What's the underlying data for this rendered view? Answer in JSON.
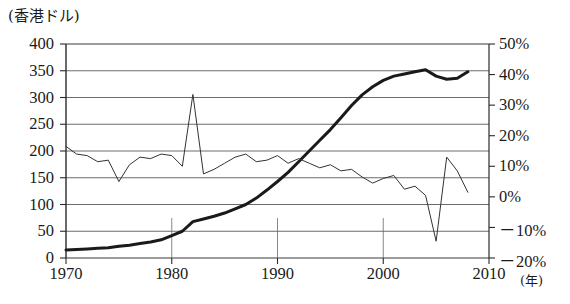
{
  "chart_data": {
    "type": "line",
    "title": "",
    "unit_label": "(香港ドル)",
    "xlabel": "(年)",
    "ylabel": "",
    "xlim": [
      1970,
      2010
    ],
    "x_ticks": [
      "1970",
      "1980",
      "1990",
      "2000",
      "2010"
    ],
    "x_tick_values": [
      1970,
      1980,
      1990,
      2000,
      2010
    ],
    "left_axis": {
      "label": "(香港ドル)",
      "ylim": [
        0,
        400
      ],
      "ticks": [
        "0",
        "50",
        "100",
        "150",
        "200",
        "250",
        "300",
        "350",
        "400"
      ],
      "tick_values": [
        0,
        50,
        100,
        150,
        200,
        250,
        300,
        350,
        400
      ]
    },
    "right_axis": {
      "label": "",
      "ylim": [
        -20,
        50
      ],
      "ticks": [
        "50%",
        "40%",
        "30%",
        "20%",
        "10%",
        "0%",
        "－10%",
        "－20%"
      ],
      "tick_values": [
        50,
        40,
        30,
        20,
        10,
        0,
        -10,
        -20
      ]
    },
    "grid": true,
    "legend": "none",
    "series": [
      {
        "name": "香港ドル",
        "axis": "left",
        "style": "thick",
        "color": "#1a1a1a",
        "x": [
          1970,
          1971,
          1972,
          1973,
          1974,
          1975,
          1976,
          1977,
          1978,
          1979,
          1980,
          1981,
          1982,
          1983,
          1984,
          1985,
          1986,
          1987,
          1988,
          1989,
          1990,
          1991,
          1992,
          1993,
          1994,
          1995,
          1996,
          1997,
          1998,
          1999,
          2000,
          2001,
          2002,
          2003,
          2004,
          2005,
          2006,
          2007,
          2008
        ],
        "values": [
          15,
          16,
          17,
          18,
          19,
          22,
          24,
          27,
          30,
          34,
          42,
          50,
          68,
          73,
          78,
          84,
          92,
          100,
          112,
          127,
          143,
          160,
          180,
          200,
          220,
          240,
          262,
          285,
          305,
          320,
          332,
          340,
          344,
          348,
          352,
          340,
          334,
          336,
          348
        ]
      },
      {
        "name": "増加率",
        "axis": "right",
        "style": "thin",
        "color": "#333333",
        "x": [
          1970,
          1971,
          1972,
          1973,
          1974,
          1975,
          1976,
          1977,
          1978,
          1979,
          1980,
          1981,
          1982,
          1983,
          1984,
          1985,
          1986,
          1987,
          1988,
          1989,
          1990,
          1991,
          1992,
          1993,
          1994,
          1995,
          1996,
          1997,
          1998,
          1999,
          2000,
          2001,
          2002,
          2003,
          2004,
          2005,
          2006,
          2007,
          2008
        ],
        "values": [
          16.5,
          14.0,
          13.5,
          11.5,
          12.0,
          5.0,
          10.5,
          13.0,
          12.5,
          14.0,
          13.5,
          10.0,
          33.5,
          7.5,
          9.0,
          11.0,
          13.0,
          14.0,
          11.5,
          12.0,
          13.5,
          11.0,
          12.5,
          11.0,
          9.5,
          10.5,
          8.5,
          9.0,
          6.5,
          4.5,
          6.0,
          7.0,
          2.5,
          3.5,
          0.5,
          -14.5,
          13.0,
          8.5,
          1.5
        ]
      }
    ]
  }
}
